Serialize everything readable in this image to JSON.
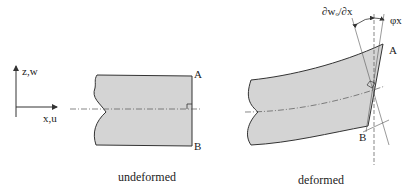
{
  "axes": {
    "vertical_label": "z,w",
    "horizontal_label": "x,u"
  },
  "undeformed": {
    "caption": "undeformed",
    "point_top": "A",
    "point_bottom": "B"
  },
  "deformed": {
    "caption": "deformed",
    "point_top": "A",
    "point_bottom": "B",
    "slope_label": "∂wₒ/∂x",
    "rotation_label": "φx"
  },
  "colors": {
    "fill": "#d4d4d4",
    "stroke": "#333333"
  }
}
